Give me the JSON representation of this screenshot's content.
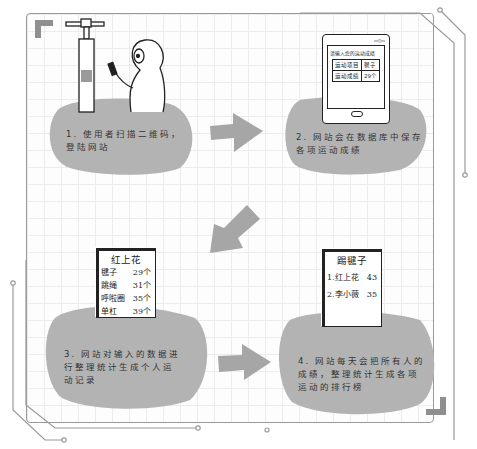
{
  "diagram": {
    "colors": {
      "blob": "#b3b3b3",
      "arrow": "#a6a6a6",
      "corner": "#8f8f8f",
      "circuit": "#9a9a9a",
      "grid": "#ececec",
      "ink": "#222222"
    },
    "steps": [
      {
        "id": 1,
        "text_line1": "1. 使用者扫描二维码，",
        "text_line2": "登陆网站",
        "illustration": "person scanning QR code on sports equipment with phone"
      },
      {
        "id": 2,
        "text_line1": "2. 网站会在数据库中保存",
        "text_line2": "各项运动成绩",
        "illustration": "tablet showing input form",
        "tablet": {
          "status": "▭▯▭",
          "prompt": "请输入您的运动成绩",
          "table": [
            [
              "运动项目",
              "毽子"
            ],
            [
              "运动成绩",
              "29个"
            ]
          ]
        }
      },
      {
        "id": 3,
        "text_line1": "3. 网站对输入的数据进",
        "text_line2": "行整理统计生成个人运",
        "text_line3": "动记录",
        "illustration": "personal record sheet",
        "record": {
          "name": "红上花",
          "rows": [
            {
              "item": "毽子",
              "value": "29个"
            },
            {
              "item": "跳绳",
              "value": "31个"
            },
            {
              "item": "呼啦圈",
              "value": "35个"
            },
            {
              "item": "单杠",
              "value": "39个"
            }
          ]
        }
      },
      {
        "id": 4,
        "text_line1": "4. 网站每天会把所有人的",
        "text_line2": "成绩，整理统计生成各项",
        "text_line3": "运动的排行榜",
        "illustration": "leaderboard sheet",
        "leaderboard": {
          "title": "踢毽子",
          "rows": [
            {
              "rank": "1.",
              "name": "红上花",
              "value": "43"
            },
            {
              "rank": "2.",
              "name": "李小薇",
              "value": "35"
            }
          ],
          "squiggles": "~~~"
        }
      }
    ],
    "arrows": [
      {
        "from": 1,
        "to": 2,
        "direction": "right"
      },
      {
        "from": 2,
        "to": 3,
        "direction": "down-left"
      },
      {
        "from": 3,
        "to": 4,
        "direction": "right"
      }
    ]
  }
}
